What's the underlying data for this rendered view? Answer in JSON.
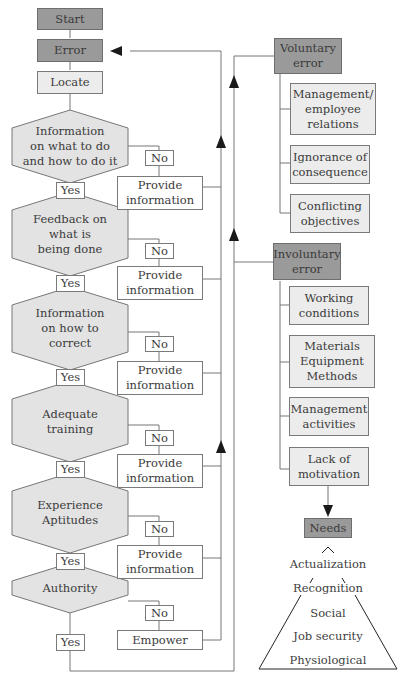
{
  "flow": {
    "start": "Start",
    "error": "Error",
    "locate": "Locate",
    "decisions": [
      {
        "question": "Information\non what to do\nand how to do it",
        "no": "No",
        "yes": "Yes",
        "action": "Provide\ninformation"
      },
      {
        "question": "Feedback on\nwhat is\nbeing done",
        "no": "No",
        "yes": "Yes",
        "action": "Provide\ninformation"
      },
      {
        "question": "Information\non how to\ncorrect",
        "no": "No",
        "yes": "Yes",
        "action": "Provide\ninformation"
      },
      {
        "question": "Adequate\ntraining",
        "no": "No",
        "yes": "Yes",
        "action": "Provide\ninformation"
      },
      {
        "question": "Experience\nAptitudes",
        "no": "No",
        "yes": "Yes",
        "action": "Provide\ninformation"
      },
      {
        "question": "Authority",
        "no": "No",
        "yes": "Yes",
        "action": "Empower"
      }
    ]
  },
  "voluntary": {
    "title": "Voluntary\nerror",
    "causes": [
      "Management/\nemployee\nrelations",
      "Ignorance of\nconsequence",
      "Conflicting\nobjectives"
    ]
  },
  "involuntary": {
    "title": "Involuntary\nerror",
    "causes": [
      "Working\nconditions",
      "Materials\nEquipment\nMethods",
      "Management\nactivities",
      "Lack of\nmotivation"
    ]
  },
  "needs": {
    "title": "Needs",
    "hierarchy": [
      "Actualization",
      "Recognition",
      "Social",
      "Job security",
      "Physiological"
    ]
  },
  "colors": {
    "dark_box": "#9a9a9a",
    "light_box": "#ececec",
    "line": "#6e6e6e",
    "arrow": "#1a1a1a"
  }
}
